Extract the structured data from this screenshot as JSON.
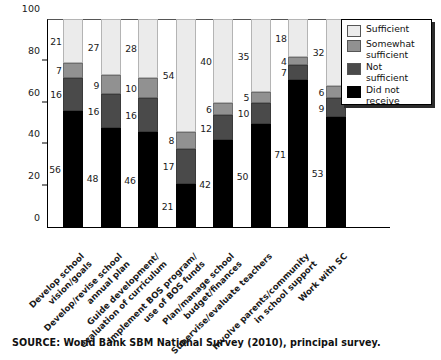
{
  "chart_data": {
    "type": "bar",
    "subtype": "stacked-vertical-100",
    "title": "",
    "xlabel": "",
    "ylabel": "Percentage",
    "ylim": [
      0,
      100
    ],
    "yticks": [
      0,
      20,
      40,
      60,
      80,
      100
    ],
    "grid": false,
    "legend_position": "top-right",
    "categories": [
      "Develop school\nvision/goals",
      "Develop/revise school\nannual plan",
      "Guide development/\nevaluation of curriculum",
      "Implement BOS program/\nuse of BOS funds",
      "Plan/manage school\nbudget/finances",
      "Supervise/evaluate teachers",
      "Involve parents/community\nin school support",
      "Work with SC"
    ],
    "series": [
      {
        "name": "Did not receive",
        "color": "#000000",
        "values": [
          56,
          48,
          46,
          21,
          42,
          50,
          71,
          53
        ]
      },
      {
        "name": "Not sufficient",
        "color": "#4a4a4a",
        "values": [
          16,
          16,
          16,
          17,
          12,
          10,
          7,
          9
        ]
      },
      {
        "name": "Somewhat sufficient",
        "color": "#919191",
        "values": [
          7,
          9,
          10,
          8,
          6,
          5,
          4,
          6
        ]
      },
      {
        "name": "Sufficient",
        "color": "#ebebeb",
        "values": [
          21,
          27,
          28,
          54,
          40,
          35,
          18,
          32
        ]
      }
    ]
  },
  "legend": {
    "items": [
      {
        "label": "Sufficient",
        "color": "#ebebeb"
      },
      {
        "label": "Somewhat\nsufficient",
        "color": "#919191"
      },
      {
        "label": "Not\nsufficient",
        "color": "#4a4a4a"
      },
      {
        "label": "Did not\nreceive",
        "color": "#000000"
      }
    ]
  },
  "source": {
    "note": "SOURCE: World Bank SBM National Survey (2010), principal survey."
  }
}
